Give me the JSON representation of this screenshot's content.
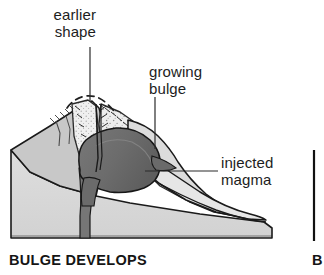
{
  "figure": {
    "name": "volcano-cross-section",
    "caption": "BULGE DEVELOPS",
    "next_panel_caption_fragment": "B"
  },
  "labels": {
    "earlier_shape": "earlier\nshape",
    "growing_bulge": "growing\nbulge",
    "injected_magma": "injected\nmagma"
  },
  "colors": {
    "outline": "#1a1a1a",
    "base_rock": "#d9d9d9",
    "flank_rock": "#c6c6c6",
    "stippled_debris": "#ececec",
    "magma": "#6f6f6f",
    "magma_shadow": "#5c5c5c",
    "background": "#ffffff",
    "leader_line": "#2b2b2b",
    "panel_divider": "#111111"
  },
  "diagram_parts": [
    {
      "id": "base-block",
      "label": "base rock block"
    },
    {
      "id": "left-flank",
      "label": "earlier volcano flank"
    },
    {
      "id": "crater-fill",
      "label": "stippled crater debris"
    },
    {
      "id": "magma-body",
      "label": "injected magma body"
    },
    {
      "id": "magma-conduit",
      "label": "magma conduit"
    },
    {
      "id": "bulge-surface",
      "label": "growing bulge surface"
    },
    {
      "id": "earlier-shape-dashed",
      "label": "earlier summit outline (dashed)"
    },
    {
      "id": "right-flank",
      "label": "right flank slope"
    }
  ],
  "leaders": [
    {
      "id": "leader-earlier-shape",
      "from_label": "earlier shape",
      "orientation": "vertical"
    },
    {
      "id": "leader-growing-bulge",
      "from_label": "growing bulge",
      "orientation": "vertical"
    },
    {
      "id": "leader-injected-magma",
      "from_label": "injected magma",
      "orientation": "horizontal"
    }
  ]
}
